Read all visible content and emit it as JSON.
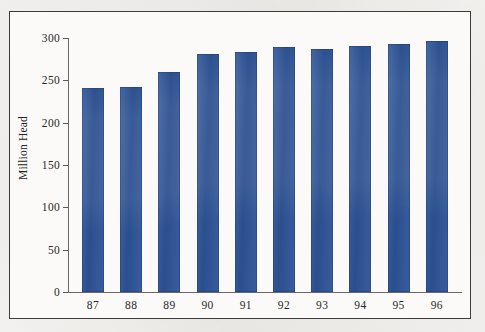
{
  "figure": {
    "background_color": "#f2f0ed",
    "frame_color": "#3d3b39",
    "plot_background": "#fbfaf8"
  },
  "chart_data": {
    "type": "bar",
    "title": "",
    "xlabel": "",
    "ylabel": "Million Head",
    "categories": [
      "87",
      "88",
      "89",
      "90",
      "91",
      "92",
      "93",
      "94",
      "95",
      "96"
    ],
    "values": [
      241,
      242,
      260,
      281,
      284,
      289,
      287,
      291,
      293,
      297
    ],
    "series": [
      {
        "name": "Million Head",
        "values": [
          241,
          242,
          260,
          281,
          284,
          289,
          287,
          291,
          293,
          297
        ],
        "color": "#2d5396"
      }
    ],
    "ylim": [
      0,
      300
    ],
    "ytick_values": [
      0,
      50,
      100,
      150,
      200,
      250,
      300
    ],
    "ytick_labels": [
      "0",
      "50",
      "100",
      "150",
      "200",
      "250",
      "300"
    ],
    "xtick_labels": [
      "87",
      "88",
      "89",
      "90",
      "91",
      "92",
      "93",
      "94",
      "95",
      "96"
    ],
    "grid": false,
    "legend": false,
    "legend_position": "none",
    "bar_color": "#2d5396",
    "axis_color": "#6a6865"
  }
}
